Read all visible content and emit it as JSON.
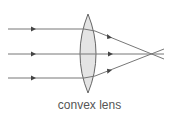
{
  "diagram": {
    "title": "convex lens",
    "colors": {
      "ray": "#777777",
      "lens_fill": "#e4e4e4",
      "lens_stroke": "#666666",
      "arrow": "#444444",
      "label": "#555555"
    },
    "lens": {
      "cx": 88,
      "top_y": 14,
      "bottom_y": 93,
      "half_width": 8
    },
    "rays": [
      {
        "name": "top",
        "y": 29
      },
      {
        "name": "middle",
        "y": 54
      },
      {
        "name": "bottom",
        "y": 78
      }
    ],
    "focal_point": {
      "x": 152,
      "y": 54
    }
  }
}
